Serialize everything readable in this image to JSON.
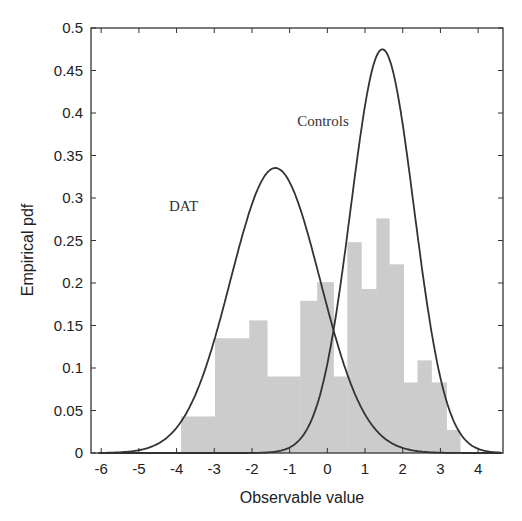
{
  "chart_data": {
    "type": "bar",
    "subtype": "histogram-with-density-curves",
    "title": "",
    "xlabel": "Observable value",
    "ylabel": "Empirical pdf",
    "xlim": [
      -6.27,
      4.66
    ],
    "ylim": [
      0,
      0.5
    ],
    "x_ticks": [
      -6,
      -5,
      -4,
      -3,
      -2,
      -1,
      0,
      1,
      2,
      3,
      4
    ],
    "y_ticks": [
      0,
      0.05,
      0.1,
      0.15,
      0.2,
      0.25,
      0.3,
      0.35,
      0.4,
      0.45,
      0.5
    ],
    "y_tick_labels": [
      "0",
      "0.05",
      "0.1",
      "0.15",
      "0.2",
      "0.25",
      "0.3",
      "0.35",
      "0.4",
      "0.45",
      "0.5"
    ],
    "grid": false,
    "legend": null,
    "histogram": {
      "color": "#cccccc",
      "bins": [
        {
          "x0": -3.88,
          "x1": -2.98,
          "height": 0.043
        },
        {
          "x0": -2.98,
          "x1": -2.07,
          "height": 0.135
        },
        {
          "x0": -2.07,
          "x1": -1.6,
          "height": 0.156
        },
        {
          "x0": -1.6,
          "x1": -0.72,
          "height": 0.09
        },
        {
          "x0": -0.72,
          "x1": -0.27,
          "height": 0.179
        },
        {
          "x0": -0.27,
          "x1": 0.16,
          "height": 0.201
        },
        {
          "x0": 0.16,
          "x1": 0.53,
          "height": 0.09
        },
        {
          "x0": 0.53,
          "x1": 0.9,
          "height": 0.248
        },
        {
          "x0": 0.9,
          "x1": 1.3,
          "height": 0.193
        },
        {
          "x0": 1.3,
          "x1": 1.64,
          "height": 0.276
        },
        {
          "x0": 1.64,
          "x1": 2.02,
          "height": 0.222
        },
        {
          "x0": 2.02,
          "x1": 2.39,
          "height": 0.083
        },
        {
          "x0": 2.39,
          "x1": 2.76,
          "height": 0.109
        },
        {
          "x0": 2.76,
          "x1": 3.16,
          "height": 0.083
        },
        {
          "x0": 3.16,
          "x1": 3.52,
          "height": 0.027
        }
      ]
    },
    "series": [
      {
        "name": "DAT",
        "kind": "gaussian-pdf",
        "mean": -1.38,
        "sd": 1.19,
        "peak": 0.334,
        "color": "#333333"
      },
      {
        "name": "Controls",
        "kind": "gaussian-pdf",
        "mean": 1.46,
        "sd": 0.84,
        "peak": 0.473,
        "color": "#333333"
      }
    ],
    "annotations": [
      {
        "text": "Controls",
        "x": -0.8,
        "y": 0.385
      },
      {
        "text": "DAT",
        "x": -4.2,
        "y": 0.285
      }
    ]
  }
}
